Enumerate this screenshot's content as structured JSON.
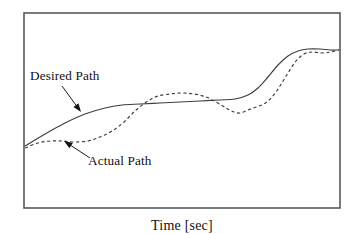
{
  "figure": {
    "axis_label_x": "Time [sec]",
    "frame": {
      "x": 24,
      "y": 13,
      "width": 316,
      "height": 195
    },
    "colors": {
      "frame_stroke": "#555a5e",
      "curve_stroke": "#3a3f44",
      "text": "#111111",
      "background": "#ffffff"
    },
    "annotations": [
      {
        "name": "desired-path",
        "label": "Desired Path",
        "text_x": 30,
        "text_y": 80,
        "leader_from": [
          62,
          86
        ],
        "leader_to": [
          81,
          112
        ]
      },
      {
        "name": "actual-path",
        "label": "Actual Path",
        "text_x": 88,
        "text_y": 165,
        "leader_from": [
          90,
          158
        ],
        "leader_to": [
          64,
          141
        ]
      }
    ]
  },
  "chart_data": {
    "type": "line",
    "title": "",
    "xlabel": "Time [sec]",
    "ylabel": "",
    "grid": false,
    "legend_position": "inline-annotations",
    "axis_ticks": {
      "x": [],
      "y": []
    },
    "xlim": [
      0,
      1
    ],
    "ylim": [
      0,
      1
    ],
    "series": [
      {
        "name": "Desired Path",
        "style": "solid",
        "points_px": [
          [
            25,
            146
          ],
          [
            45,
            134
          ],
          [
            65,
            123
          ],
          [
            85,
            114
          ],
          [
            105,
            108
          ],
          [
            122,
            105
          ],
          [
            140,
            104
          ],
          [
            160,
            103
          ],
          [
            180,
            102
          ],
          [
            200,
            101
          ],
          [
            220,
            100
          ],
          [
            235,
            99
          ],
          [
            248,
            95
          ],
          [
            258,
            88
          ],
          [
            268,
            77
          ],
          [
            278,
            65
          ],
          [
            288,
            56
          ],
          [
            298,
            51
          ],
          [
            308,
            49
          ],
          [
            320,
            49
          ],
          [
            330,
            50
          ],
          [
            339,
            50
          ]
        ],
        "points_norm": {
          "x": [
            0.0,
            0.06,
            0.13,
            0.19,
            0.25,
            0.31,
            0.37,
            0.43,
            0.49,
            0.55,
            0.62,
            0.67,
            0.71,
            0.74,
            0.77,
            0.8,
            0.84,
            0.87,
            0.9,
            0.94,
            0.97,
            1.0
          ],
          "y": [
            0.32,
            0.38,
            0.44,
            0.48,
            0.51,
            0.53,
            0.53,
            0.54,
            0.54,
            0.55,
            0.55,
            0.56,
            0.58,
            0.62,
            0.67,
            0.73,
            0.78,
            0.81,
            0.82,
            0.82,
            0.81,
            0.81
          ]
        }
      },
      {
        "name": "Actual Path",
        "style": "dashed",
        "points_px": [
          [
            25,
            148
          ],
          [
            38,
            143
          ],
          [
            50,
            141
          ],
          [
            62,
            141
          ],
          [
            74,
            142
          ],
          [
            88,
            141
          ],
          [
            100,
            137
          ],
          [
            112,
            131
          ],
          [
            124,
            122
          ],
          [
            136,
            110
          ],
          [
            148,
            101
          ],
          [
            158,
            96
          ],
          [
            170,
            94
          ],
          [
            182,
            93
          ],
          [
            194,
            94
          ],
          [
            206,
            97
          ],
          [
            216,
            102
          ],
          [
            226,
            108
          ],
          [
            234,
            112
          ],
          [
            240,
            113
          ],
          [
            248,
            110
          ],
          [
            256,
            107
          ],
          [
            264,
            104
          ],
          [
            272,
            97
          ],
          [
            280,
            86
          ],
          [
            288,
            73
          ],
          [
            296,
            61
          ],
          [
            304,
            54
          ],
          [
            312,
            52
          ],
          [
            322,
            53
          ],
          [
            331,
            52
          ],
          [
            339,
            50
          ]
        ],
        "points_norm": {
          "x": [
            0.0,
            0.04,
            0.08,
            0.12,
            0.16,
            0.2,
            0.24,
            0.28,
            0.31,
            0.35,
            0.39,
            0.42,
            0.46,
            0.5,
            0.54,
            0.57,
            0.61,
            0.64,
            0.66,
            0.68,
            0.71,
            0.73,
            0.76,
            0.78,
            0.81,
            0.84,
            0.86,
            0.89,
            0.91,
            0.94,
            0.97,
            1.0
          ],
          "y": [
            0.31,
            0.33,
            0.34,
            0.34,
            0.34,
            0.34,
            0.36,
            0.39,
            0.44,
            0.5,
            0.55,
            0.57,
            0.58,
            0.59,
            0.58,
            0.57,
            0.54,
            0.51,
            0.49,
            0.49,
            0.5,
            0.52,
            0.53,
            0.57,
            0.63,
            0.69,
            0.75,
            0.79,
            0.8,
            0.79,
            0.8,
            0.81
          ]
        }
      }
    ]
  }
}
